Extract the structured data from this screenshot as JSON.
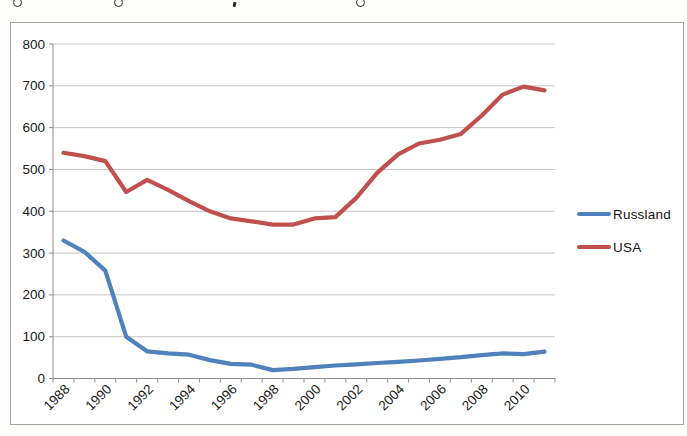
{
  "cropped_title": {
    "fragments": [
      {
        "type": "g-loop",
        "left": 13
      },
      {
        "type": "g-loop",
        "left": 114
      },
      {
        "type": "comma",
        "left": 233
      },
      {
        "type": "g-loop",
        "left": 356
      }
    ]
  },
  "chart_data": {
    "type": "line",
    "x": [
      1988,
      1989,
      1990,
      1991,
      1992,
      1993,
      1994,
      1995,
      1996,
      1997,
      1998,
      1999,
      2000,
      2001,
      2002,
      2003,
      2004,
      2005,
      2006,
      2007,
      2008,
      2009,
      2010,
      2011
    ],
    "x_tick_labels": [
      "1988",
      "1990",
      "1992",
      "1994",
      "1996",
      "1998",
      "2000",
      "2002",
      "2004",
      "2006",
      "2008",
      "2010"
    ],
    "yticks": [
      0,
      100,
      200,
      300,
      400,
      500,
      600,
      700,
      800
    ],
    "ylim": [
      0,
      800
    ],
    "grid": true,
    "legend_position": "right",
    "series": [
      {
        "name": "Russland",
        "color": "#4F81BD",
        "values": [
          330,
          303,
          258,
          100,
          65,
          60,
          57,
          44,
          35,
          33,
          20,
          23,
          27,
          31,
          34,
          37,
          40,
          43,
          47,
          51,
          56,
          60,
          58,
          64
        ]
      },
      {
        "name": "USA",
        "color": "#C0504D",
        "values": [
          540,
          532,
          520,
          446,
          475,
          451,
          424,
          400,
          383,
          376,
          368,
          368,
          383,
          386,
          432,
          492,
          536,
          562,
          571,
          585,
          629,
          679,
          698,
          689
        ]
      }
    ]
  },
  "colors": {
    "gridline": "#c6c6c4",
    "axis": "#8c8c8a",
    "tick_text": "#1a1a1a",
    "frame_border": "#a3a3a0",
    "background": "#ffffff"
  }
}
